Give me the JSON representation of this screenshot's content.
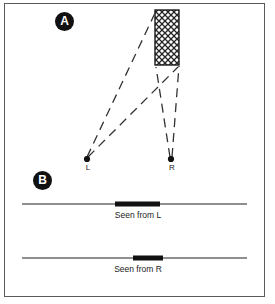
{
  "figure": {
    "panels": [
      {
        "id": "A",
        "badge_label": "A",
        "description": "Top-down scene view with two viewpoints and an occluding textured object",
        "object": {
          "name": "hatched-rectangle",
          "fill_pattern": "crosshatch",
          "x": 155,
          "y": 10,
          "width": 24,
          "height": 55
        },
        "viewpoints": [
          {
            "name": "L",
            "label": "L",
            "x": 87,
            "y": 159
          },
          {
            "name": "R",
            "label": "R",
            "x": 171,
            "y": 159
          }
        ],
        "sightlines": [
          {
            "from": "L",
            "to_x": 156,
            "to_y": 11
          },
          {
            "from": "L",
            "to_x": 178,
            "to_y": 66
          },
          {
            "from": "R",
            "to_x": 157,
            "to_y": 67
          },
          {
            "from": "R",
            "to_x": 179,
            "to_y": 66
          }
        ]
      },
      {
        "id": "B",
        "badge_label": "B",
        "description": "Two one-dimensional retinal projections of the object",
        "views": [
          {
            "name": "seen-from-L",
            "caption": "Seen from L",
            "axis": {
              "x1": 22,
              "x2": 247,
              "y": 204
            },
            "bar": {
              "x1": 115,
              "x2": 160,
              "y": 204,
              "thickness": 5
            }
          },
          {
            "name": "seen-from-R",
            "caption": "Seen from R",
            "axis": {
              "x1": 22,
              "x2": 247,
              "y": 258
            },
            "bar": {
              "x1": 133,
              "x2": 163,
              "y": 258,
              "thickness": 5
            }
          }
        ]
      }
    ],
    "colors": {
      "ink": "#1a1a1a",
      "frame": "#5a5a5a",
      "badge_fill": "#111111",
      "badge_text": "#ffffff",
      "axis_line": "#6a6a6a",
      "bar_fill": "#111111",
      "hatch": "#262626",
      "background": "#ffffff"
    }
  }
}
